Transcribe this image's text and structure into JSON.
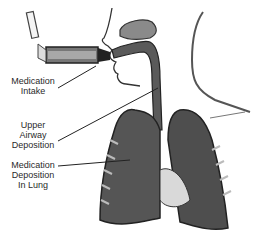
{
  "figure": {
    "labels": [
      {
        "id": "intake",
        "lines": [
          "Medication",
          "Intake"
        ]
      },
      {
        "id": "upper",
        "lines": [
          "Upper",
          "Airway",
          "Deposition"
        ]
      },
      {
        "id": "lung",
        "lines": [
          "Medication",
          "Deposition",
          "In Lung"
        ]
      }
    ]
  }
}
